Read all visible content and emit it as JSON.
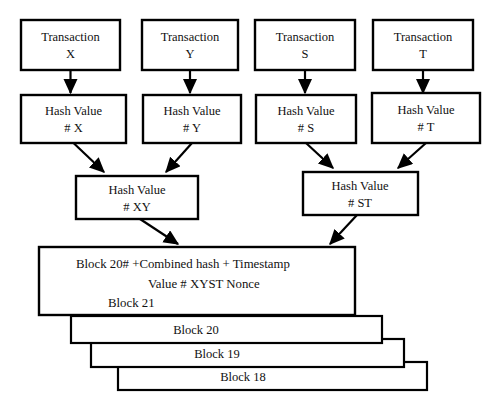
{
  "diagram": {
    "colors": {
      "stroke": "#000000",
      "fill": "#ffffff",
      "background": "#ffffff"
    },
    "transactions": [
      {
        "line1": "Transaction",
        "line2": "X"
      },
      {
        "line1": "Transaction",
        "line2": "Y"
      },
      {
        "line1": "Transaction",
        "line2": "S"
      },
      {
        "line1": "Transaction",
        "line2": "T"
      }
    ],
    "hashes": [
      {
        "line1": "Hash Value",
        "line2": "# X"
      },
      {
        "line1": "Hash Value",
        "line2": "# Y"
      },
      {
        "line1": "Hash Value",
        "line2": "# S"
      },
      {
        "line1": "Hash Value",
        "line2": "# T"
      }
    ],
    "combined_hashes": [
      {
        "line1": "Hash Value",
        "line2": "# XY"
      },
      {
        "line1": "Hash Value",
        "line2": "# ST"
      }
    ],
    "current_block": {
      "line1": "Block 20# +Combined hash + Timestamp",
      "line2": "Value # XYST      Nonce",
      "line3": "Block 21"
    },
    "block_stack": [
      {
        "label": "Block 20"
      },
      {
        "label": "Block 19"
      },
      {
        "label": "Block 18"
      }
    ]
  }
}
